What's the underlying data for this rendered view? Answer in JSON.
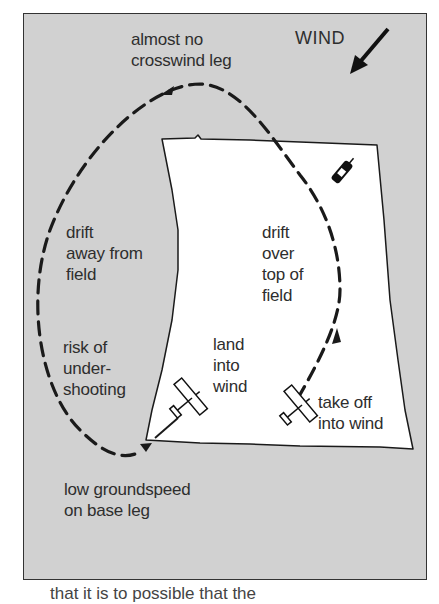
{
  "diagram": {
    "type": "crosswind circuit illustration",
    "colors": {
      "background": "#d1d1d1",
      "field": "#ffffff",
      "ink": "#1a1a1a",
      "text": "#2e2e2e"
    },
    "wind_label": "WIND",
    "labels": {
      "crosswind": "almost no\ncrosswind leg",
      "drift_away": "drift\naway from\nfield",
      "undershoot": "risk of\nunder-\nshooting",
      "drift_over": "drift\nover\ntop of\nfield",
      "land": "land\ninto\nwind",
      "takeoff": "take off\ninto wind",
      "base_leg": "low groundspeed\non base leg"
    },
    "icons": {
      "wind_arrow": "arrow-down-left",
      "windsock": "windsock-icon",
      "plane_landing": "airplane-icon",
      "plane_takeoff": "airplane-icon"
    },
    "caption_partial": "that it is to possible that the"
  }
}
